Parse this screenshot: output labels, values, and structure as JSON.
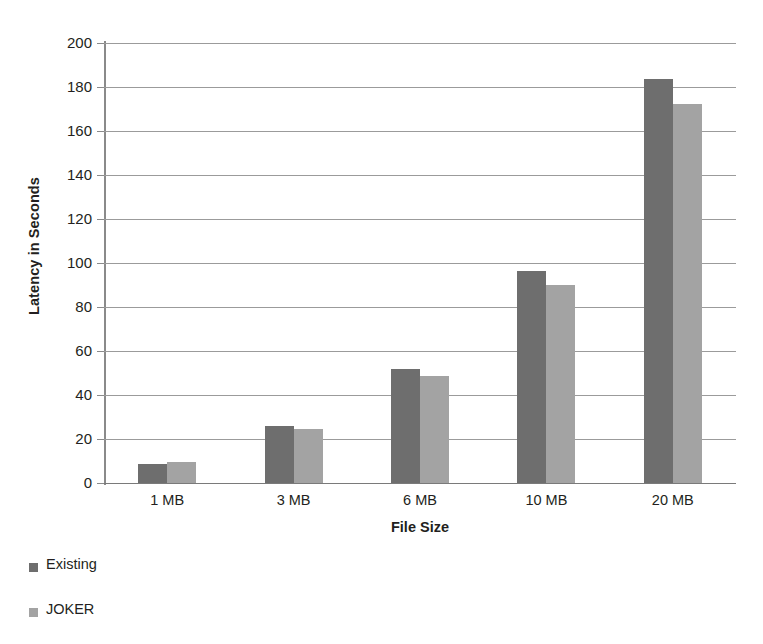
{
  "chart_data": {
    "type": "bar",
    "title": "",
    "xlabel": "File Size",
    "ylabel": "Latency in Seconds",
    "categories": [
      "1 MB",
      "3 MB",
      "6 MB",
      "10 MB",
      "20 MB"
    ],
    "series": [
      {
        "name": "Existing",
        "color": "#6e6e6e",
        "values": [
          8.5,
          26,
          52,
          96.5,
          183.5
        ]
      },
      {
        "name": "JOKER",
        "color": "#a3a3a3",
        "values": [
          9.5,
          24.5,
          48.5,
          90,
          172.5
        ]
      }
    ],
    "ylim": [
      0,
      200
    ],
    "ytick_step": 20,
    "yticks": [
      "200",
      "180",
      "160",
      "140",
      "120",
      "100",
      "80",
      "60",
      "40",
      "20",
      "0"
    ],
    "grid": true,
    "legend_position": "bottom-left",
    "legend": [
      {
        "label": "Existing",
        "color": "#6e6e6e"
      },
      {
        "label": "JOKER",
        "color": "#a3a3a3"
      }
    ]
  },
  "colors": {
    "series_existing": "#6e6e6e",
    "series_joker": "#a3a3a3",
    "gridline": "#9b9b9b",
    "axis": "#8a8a8a",
    "text": "#231f20",
    "background": "#ffffff"
  }
}
